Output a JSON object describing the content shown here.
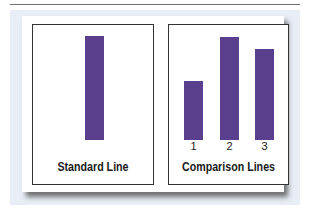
{
  "figure": {
    "colors": {
      "bar": "#5b3f8f",
      "background_panel": "#e9eef6",
      "border": "#333333"
    },
    "panels": [
      {
        "label": "Standard Line",
        "bars": [
          {
            "height_px": 104
          }
        ]
      },
      {
        "label": "Comparison Lines",
        "bars": [
          {
            "number": "1",
            "height_px": 59
          },
          {
            "number": "2",
            "height_px": 103
          },
          {
            "number": "3",
            "height_px": 91
          }
        ]
      }
    ]
  }
}
